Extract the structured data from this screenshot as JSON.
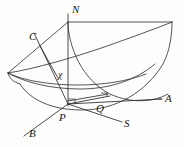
{
  "figure": {
    "kind": "3d-geometric-diagram",
    "background_color": "#fdfdfc",
    "stroke_color": "#2b2b2b",
    "label_color": "#161616",
    "width": 184,
    "height": 147
  },
  "labels": [
    {
      "id": "N",
      "text": "N",
      "x": 72,
      "y": 4,
      "role": "axis-label-vertical"
    },
    {
      "id": "C",
      "text": "C",
      "x": 29,
      "y": 31,
      "role": "point-label"
    },
    {
      "id": "chi",
      "text": "χ",
      "x": 58,
      "y": 70,
      "role": "angle-label"
    },
    {
      "id": "A",
      "text": "A",
      "x": 165,
      "y": 93,
      "role": "axis-label-right"
    },
    {
      "id": "Q",
      "text": "Q",
      "x": 96,
      "y": 103,
      "role": "point-label"
    },
    {
      "id": "P",
      "text": "P",
      "x": 59,
      "y": 112,
      "role": "origin-label"
    },
    {
      "id": "S",
      "text": "S",
      "x": 124,
      "y": 118,
      "role": "axis-label-lower-right"
    },
    {
      "id": "B",
      "text": "B",
      "x": 29,
      "y": 128,
      "role": "axis-label-lower-left"
    }
  ],
  "geometry": {
    "origin_point": {
      "name": "P",
      "x": 68,
      "y": 104
    },
    "axes": [
      {
        "name": "PN",
        "from": "P",
        "to": "N",
        "x1": 68,
        "y1": 104,
        "x2": 68,
        "y2": 14
      },
      {
        "name": "PA",
        "from": "P",
        "to": "A",
        "x1": 68,
        "y1": 104,
        "x2": 162,
        "y2": 99
      },
      {
        "name": "PB",
        "from": "P",
        "to": "B",
        "x1": 68,
        "y1": 104,
        "x2": 25,
        "y2": 134
      },
      {
        "name": "PS",
        "from": "P",
        "to": "S",
        "x1": 68,
        "y1": 104,
        "x2": 122,
        "y2": 122
      },
      {
        "name": "PC",
        "from": "P",
        "to": "C",
        "x1": 68,
        "y1": 104,
        "x2": 36,
        "y2": 36
      }
    ],
    "markers": [
      {
        "name": "right-angle-at-P",
        "x": 68,
        "y": 100
      },
      {
        "name": "right-angle-at-Q",
        "x": 103,
        "y": 96
      }
    ]
  }
}
